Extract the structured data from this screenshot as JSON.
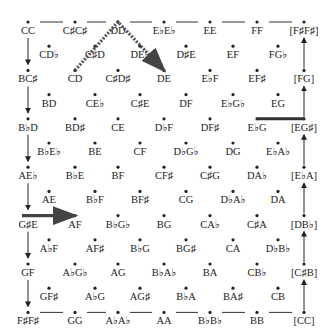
{
  "diagram": {
    "type": "voice-leading lattice",
    "rows": [
      {
        "kind": "main",
        "nodes": [
          "CC",
          "C♯C♯",
          "DD",
          "E♭E♭",
          "EE",
          "FF",
          "[F♯F♯]"
        ]
      },
      {
        "kind": "offset",
        "nodes": [
          "CD♭",
          "C♯D",
          "DE♭",
          "D♯E",
          "EF",
          "FG♭"
        ]
      },
      {
        "kind": "main",
        "nodes": [
          "BC♯",
          "CD",
          "C♯D♯",
          "DE",
          "E♭F",
          "EF♯",
          "[FG]"
        ]
      },
      {
        "kind": "offset",
        "nodes": [
          "BD",
          "CE♭",
          "C♯E",
          "DF",
          "E♭G♭",
          "EG"
        ]
      },
      {
        "kind": "main",
        "nodes": [
          "B♭D",
          "BD♯",
          "CE",
          "D♭F",
          "DF♯",
          "E♭G",
          "[EG♯]"
        ]
      },
      {
        "kind": "offset",
        "nodes": [
          "B♭E♭",
          "BE",
          "CF",
          "D♭G♭",
          "DG",
          "E♭A♭"
        ]
      },
      {
        "kind": "main",
        "nodes": [
          "AE♭",
          "B♭E",
          "BF",
          "CF♯",
          "C♯G",
          "DA♭",
          "[E♭A]"
        ]
      },
      {
        "kind": "offset",
        "nodes": [
          "AE",
          "B♭F",
          "BF♯",
          "CG",
          "D♭A♭",
          "DA"
        ]
      },
      {
        "kind": "main",
        "nodes": [
          "G♯E",
          "AF",
          "B♭G♭",
          "BG",
          "CA♭",
          "C♯A",
          "[DB♭]"
        ]
      },
      {
        "kind": "offset",
        "nodes": [
          "A♭F",
          "AF♯",
          "B♭G",
          "BG♯",
          "CA",
          "D♭B♭"
        ]
      },
      {
        "kind": "main",
        "nodes": [
          "GF",
          "A♭G♭",
          "AG",
          "B♭A♭",
          "BA",
          "CB♭",
          "[C♯B]"
        ]
      },
      {
        "kind": "offset",
        "nodes": [
          "GF♯",
          "A♭G",
          "AG♯",
          "B♭A",
          "BA♯",
          "CB"
        ]
      },
      {
        "kind": "main",
        "nodes": [
          "F♯F♯",
          "GG",
          "A♭A♭",
          "AA",
          "B♭B♭",
          "BB",
          "[CC]"
        ]
      }
    ],
    "highlighted_paths": [
      {
        "style": "dotted-thick",
        "from": "CD",
        "via": "DD",
        "to": "DE"
      },
      {
        "style": "solid-thick",
        "from": "E♭G",
        "to": "[EG♯]"
      },
      {
        "style": "solid-thick-arrow",
        "from": "G♯E",
        "to": "AF"
      }
    ]
  }
}
